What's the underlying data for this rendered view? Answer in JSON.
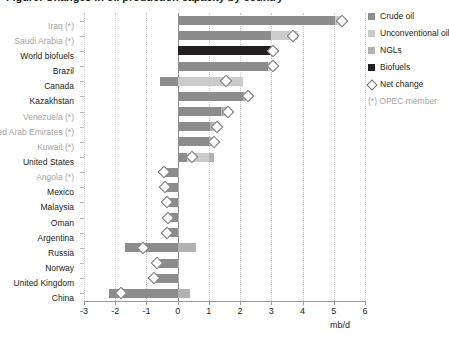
{
  "title": "Figure: Changes in oil production capacity by country",
  "legend": {
    "items": [
      {
        "label": "Crude oil",
        "color": "#8c8c8c",
        "type": "swatch"
      },
      {
        "label": "Unconventional oil",
        "color": "#cbcbcb",
        "type": "swatch"
      },
      {
        "label": "NGLs",
        "color": "#b2b2b2",
        "type": "swatch"
      },
      {
        "label": "Biofuels",
        "color": "#231f20",
        "type": "swatch"
      },
      {
        "label": "Net change",
        "color": "#ffffff",
        "type": "diamond"
      }
    ],
    "note": "(*) OPEC member"
  },
  "axis": {
    "unit": "mb/d",
    "ticks": [
      "-3",
      "-2",
      "-1",
      "0",
      "1",
      "2",
      "3",
      "4",
      "5",
      "6"
    ]
  },
  "chart_data": {
    "type": "bar",
    "orientation": "horizontal",
    "stacked": true,
    "title": "Figure: Changes in oil production capacity by country",
    "xlabel": "mb/d",
    "ylabel": "",
    "xlim": [
      -3,
      6
    ],
    "grid": true,
    "legend_position": "right",
    "categories": [
      "Iraq (*)",
      "Saudi Arabia (*)",
      "World biofuels",
      "Brazil",
      "Canada",
      "Kazakhstan",
      "Venezuela (*)",
      "United Arab Emirates (*)",
      "Kuwait (*)",
      "United States",
      "Angola (*)",
      "Mexico",
      "Malaysia",
      "Oman",
      "Argentina",
      "Russia",
      "Norway",
      "United Kingdom",
      "China"
    ],
    "opec_members": [
      "Iraq (*)",
      "Saudi Arabia (*)",
      "Venezuela (*)",
      "United Arab Emirates (*)",
      "Kuwait (*)",
      "Angola (*)"
    ],
    "series": [
      {
        "name": "Crude oil",
        "color": "#8c8c8c",
        "values": [
          5.05,
          3.0,
          0.0,
          2.9,
          -0.55,
          2.1,
          1.4,
          1.05,
          1.0,
          0.3,
          -0.5,
          -0.45,
          -0.4,
          -0.35,
          -0.4,
          -1.7,
          -0.7,
          -0.8,
          -2.2
        ]
      },
      {
        "name": "Unconventional oil",
        "color": "#cbcbcb",
        "values": [
          0.25,
          0.85,
          0.0,
          0.25,
          2.1,
          0.0,
          0.0,
          0.0,
          0.0,
          0.7,
          0.0,
          0.0,
          0.0,
          0.0,
          0.0,
          0.0,
          0.0,
          0.0,
          0.0
        ]
      },
      {
        "name": "NGLs",
        "color": "#b2b2b2",
        "values": [
          0.0,
          0.0,
          0.0,
          0.0,
          0.0,
          0.2,
          0.25,
          0.25,
          0.2,
          0.15,
          0.05,
          0.05,
          0.05,
          0.05,
          0.05,
          0.6,
          0.05,
          0.05,
          0.4
        ]
      },
      {
        "name": "Biofuels",
        "color": "#231f20",
        "values": [
          0.0,
          0.0,
          3.05,
          0.0,
          0.0,
          0.0,
          0.0,
          0.0,
          0.0,
          0.0,
          0.0,
          0.0,
          0.0,
          0.0,
          0.0,
          0.0,
          0.0,
          0.0,
          0.0
        ]
      }
    ],
    "net_change": {
      "name": "Net change",
      "values": [
        5.25,
        3.7,
        3.05,
        3.05,
        1.55,
        2.25,
        1.6,
        1.25,
        1.15,
        0.45,
        -0.45,
        -0.4,
        -0.35,
        -0.3,
        -0.35,
        -1.1,
        -0.65,
        -0.75,
        -1.8
      ]
    }
  }
}
